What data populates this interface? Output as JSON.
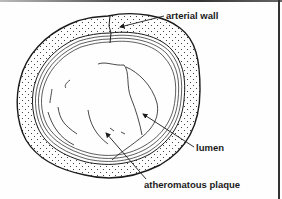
{
  "diagram": {
    "labels": {
      "arterial_wall": "arterial wall",
      "lumen": "lumen",
      "plaque": "atheromatous plaque"
    },
    "colors": {
      "ink": "#1a1a1a",
      "background": "#fefefe",
      "border": "#333333"
    }
  }
}
